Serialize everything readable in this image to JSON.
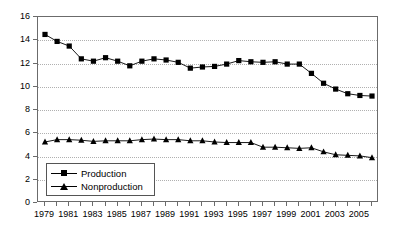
{
  "chart_data": {
    "type": "line",
    "title": "",
    "xlabel": "",
    "ylabel": "",
    "ylim": [
      0,
      16
    ],
    "ytick_values": [
      0,
      2,
      4,
      6,
      8,
      10,
      12,
      14,
      16
    ],
    "ytick_labels": [
      "0",
      "2",
      "4",
      "6",
      "8",
      "10",
      "12",
      "14",
      "16"
    ],
    "grid": "horizontal-dotted",
    "legend_position": "lower-left-inside",
    "x": [
      1979,
      1980,
      1981,
      1982,
      1983,
      1984,
      1985,
      1986,
      1987,
      1988,
      1989,
      1990,
      1991,
      1992,
      1993,
      1994,
      1995,
      1996,
      1997,
      1998,
      1999,
      2000,
      2001,
      2002,
      2003,
      2004,
      2005,
      2006
    ],
    "xtick_values": [
      1979,
      1980,
      1981,
      1982,
      1983,
      1984,
      1985,
      1986,
      1987,
      1988,
      1989,
      1990,
      1991,
      1992,
      1993,
      1994,
      1995,
      1996,
      1997,
      1998,
      1999,
      2000,
      2001,
      2002,
      2003,
      2004,
      2005,
      2006
    ],
    "xtick_labels": [
      "1979",
      "",
      "1981",
      "",
      "1983",
      "",
      "1985",
      "",
      "1987",
      "",
      "1989",
      "",
      "1991",
      "",
      "1993",
      "",
      "1995",
      "",
      "1997",
      "",
      "1999",
      "",
      "2001",
      "",
      "2003",
      "",
      "2005",
      ""
    ],
    "series": [
      {
        "name": "Production",
        "marker": "square",
        "color": "#000000",
        "values": [
          14.5,
          13.9,
          13.5,
          12.4,
          12.2,
          12.5,
          12.2,
          11.8,
          12.2,
          12.4,
          12.3,
          12.1,
          11.6,
          11.7,
          11.75,
          11.95,
          12.25,
          12.15,
          12.1,
          12.15,
          11.95,
          11.95,
          11.15,
          10.3,
          9.8,
          9.4,
          9.25,
          9.2
        ]
      },
      {
        "name": "Nonproduction",
        "marker": "triangle",
        "color": "#000000",
        "values": [
          5.25,
          5.45,
          5.45,
          5.4,
          5.3,
          5.35,
          5.35,
          5.35,
          5.45,
          5.5,
          5.45,
          5.45,
          5.35,
          5.35,
          5.25,
          5.2,
          5.2,
          5.2,
          4.8,
          4.8,
          4.75,
          4.7,
          4.75,
          4.4,
          4.15,
          4.1,
          4.05,
          3.9
        ]
      }
    ]
  },
  "legend": {
    "items": [
      {
        "label": "Production"
      },
      {
        "label": "Nonproduction"
      }
    ]
  }
}
